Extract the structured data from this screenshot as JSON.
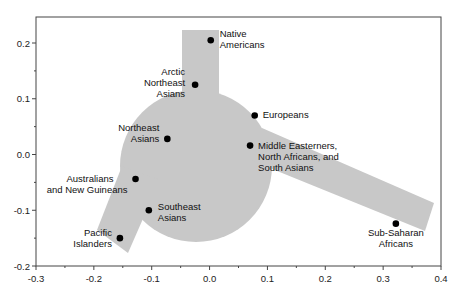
{
  "chart_data": {
    "type": "scatter",
    "title": "",
    "xlabel": "",
    "ylabel": "",
    "xlim": [
      -0.3,
      0.4
    ],
    "ylim": [
      -0.2,
      0.25
    ],
    "xticks": [
      "-0.3",
      "-0.2",
      "-0.1",
      "0.0",
      "0.1",
      "0.2",
      "0.3",
      "0.4"
    ],
    "yticks": [
      "0.2",
      "0.1",
      "0.0",
      "-0.1",
      "-0.2"
    ],
    "grid": false,
    "legend": null,
    "background_shape": "gray circle with three arms (up, lower-left, right)",
    "points": [
      {
        "label": "Native Americans",
        "lines": [
          "Native",
          "Americans"
        ],
        "x": 0.002,
        "y": 0.205
      },
      {
        "label": "Arctic Northeast Asians",
        "lines": [
          "Arctic",
          "Northeast",
          "Asians"
        ],
        "x": -0.025,
        "y": 0.125
      },
      {
        "label": "Europeans",
        "lines": [
          "Europeans"
        ],
        "x": 0.078,
        "y": 0.07
      },
      {
        "label": "Northeast Asians",
        "lines": [
          "Northeast",
          "Asians"
        ],
        "x": -0.073,
        "y": 0.028
      },
      {
        "label": "Middle Easterners, North Africans, and South Asians",
        "lines": [
          "Middle Easterners,",
          "North Africans, and",
          "South Asians"
        ],
        "x": 0.07,
        "y": 0.016
      },
      {
        "label": "Australians and New Guineans",
        "lines": [
          "Australians",
          "and New Guineans"
        ],
        "x": -0.128,
        "y": -0.044
      },
      {
        "label": "Southeast Asians",
        "lines": [
          "Southeast",
          "Asians"
        ],
        "x": -0.105,
        "y": -0.1
      },
      {
        "label": "Pacific Islanders",
        "lines": [
          "Pacific",
          "Islanders"
        ],
        "x": -0.155,
        "y": -0.15
      },
      {
        "label": "Sub-Saharan Africans",
        "lines": [
          "Sub-Saharan",
          "Africans"
        ],
        "x": 0.322,
        "y": -0.124
      }
    ],
    "colors": {
      "shape_fill": "#c8c8c8",
      "point": "#000000",
      "axis": "#333333"
    }
  }
}
